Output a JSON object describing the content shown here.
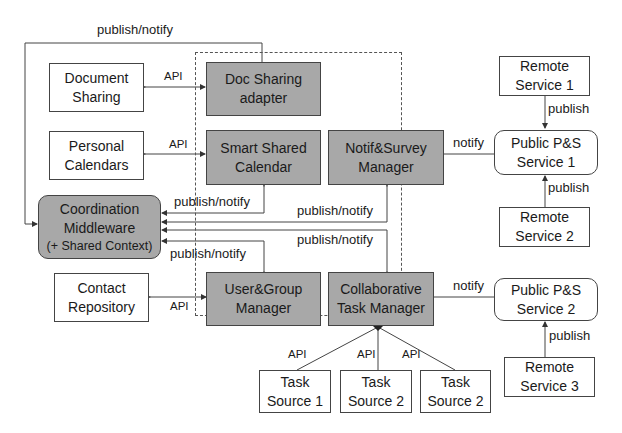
{
  "diagram": {
    "boxes": {
      "document_sharing": [
        "Document",
        "Sharing"
      ],
      "personal_calendars": [
        "Personal",
        "Calendars"
      ],
      "coordination_middleware": [
        "Coordination",
        "Middleware",
        "(+ Shared Context)"
      ],
      "contact_repository": [
        "Contact",
        "Repository"
      ],
      "doc_sharing_adapter": [
        "Doc Sharing",
        "adapter"
      ],
      "smart_shared_calendar": [
        "Smart Shared",
        "Calendar"
      ],
      "notif_survey_manager": [
        "Notif&Survey",
        "Manager"
      ],
      "user_group_manager": [
        "User&Group",
        "Manager"
      ],
      "collaborative_task_manager": [
        "Collaborative",
        "Task Manager"
      ],
      "remote_service_1": [
        "Remote",
        "Service  1"
      ],
      "public_ps_service_1": [
        "Public P&S",
        "Service 1"
      ],
      "remote_service_2": [
        "Remote",
        "Service 2"
      ],
      "public_ps_service_2": [
        "Public P&S",
        "Service 2"
      ],
      "remote_service_3": [
        "Remote",
        "Service 3"
      ],
      "task_source_1": [
        "Task",
        "Source 1"
      ],
      "task_source_2a": [
        "Task",
        "Source 2"
      ],
      "task_source_2b": [
        "Task",
        "Source 2"
      ]
    },
    "labels": {
      "top_publish_notify": "publish/notify",
      "api_doc": "API",
      "api_cal": "API",
      "api_contact": "API",
      "pn_calendar": "publish/notify",
      "pn_notif": "publish/notify",
      "pn_task": "publish/notify",
      "pn_user": "publish/notify",
      "notify_1": "notify",
      "notify_2": "notify",
      "publish_rs1": "publish",
      "publish_rs2": "publish",
      "publish_rs3": "publish",
      "api_ts1": "API",
      "api_ts2": "API",
      "api_ts3": "API"
    },
    "colors": {
      "component_fill": "#a8a8a8",
      "external_fill": "#ffffff",
      "line": "#444444"
    }
  }
}
